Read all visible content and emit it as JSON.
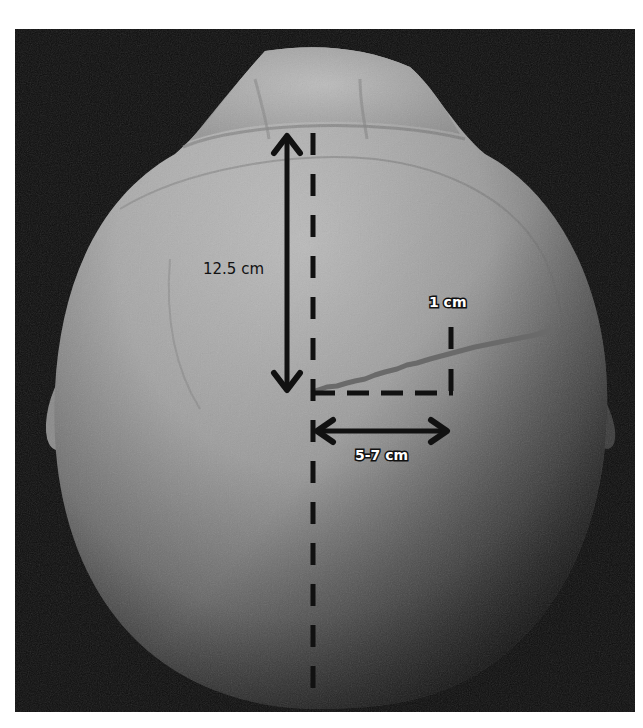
{
  "image": {
    "description": "Top-down photograph of a human skull with measurement annotations",
    "background_color": "#0d0d0d",
    "frame": {
      "x": 15,
      "y": 29,
      "width": 620,
      "height": 683
    }
  },
  "annotations": {
    "vertical_measure": {
      "label": "12.5 cm",
      "type": "double-arrow"
    },
    "small_vertical_measure": {
      "label": "1 cm",
      "type": "dashed-line"
    },
    "horizontal_measure": {
      "label": "5-7 cm",
      "type": "double-arrow"
    },
    "midline": {
      "type": "dashed-line"
    },
    "suture_line": {
      "type": "irregular-line",
      "color": "#6a6a6a"
    }
  },
  "colors": {
    "bone_light": "#c9c9c9",
    "bone_mid": "#a8a8a8",
    "bone_dark": "#6e6e6e",
    "annotation": "#111111",
    "label_outline_text": "#ffffff"
  }
}
